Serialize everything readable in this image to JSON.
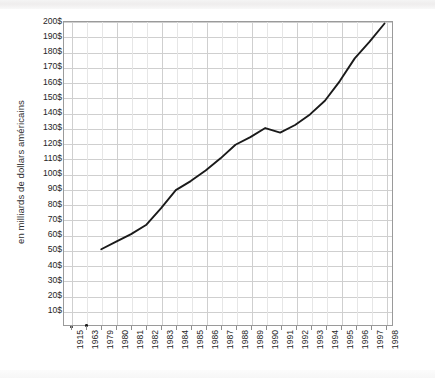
{
  "chart_data": {
    "type": "line",
    "title": "",
    "xlabel": "",
    "ylabel": "en milliards de dollars américains",
    "ylim": [
      0,
      200
    ],
    "y_tick_values": [
      200,
      190,
      180,
      170,
      160,
      150,
      140,
      130,
      120,
      110,
      100,
      90,
      80,
      70,
      60,
      50,
      40,
      30,
      20,
      10
    ],
    "y_tick_labels": [
      "200$",
      "190$",
      "180$",
      "170$",
      "160$",
      "150$",
      "140$",
      "130$",
      "120$",
      "110$",
      "100$",
      "90$",
      "80$",
      "70$",
      "60$",
      "50$",
      "40$",
      "30$",
      "20$",
      "10$"
    ],
    "categories": [
      "1915",
      "1963",
      "1979",
      "1980",
      "1981",
      "1982",
      "1983",
      "1984",
      "1985",
      "1986",
      "1987",
      "1988",
      "1989",
      "1990",
      "1991",
      "1992",
      "1993",
      "1994",
      "1995",
      "1996",
      "1997",
      "1998"
    ],
    "values": [
      0,
      1,
      50,
      55,
      60,
      66,
      77,
      89,
      95,
      102,
      110,
      119,
      124,
      130,
      127,
      132,
      139,
      148,
      161,
      176,
      187,
      199
    ],
    "series": [
      {
        "name": "dépenses",
        "values": [
          0,
          1,
          50,
          55,
          60,
          66,
          77,
          89,
          95,
          102,
          110,
          119,
          124,
          130,
          127,
          132,
          139,
          148,
          161,
          176,
          187,
          199
        ]
      }
    ],
    "line_start_category": "1979",
    "marker_only_categories": [
      "1915",
      "1963"
    ],
    "grid": true,
    "legend": "none",
    "line_color": "#1a1a1a",
    "grid_color": "#cfcfcf",
    "axis_color": "#9a9a9a"
  }
}
